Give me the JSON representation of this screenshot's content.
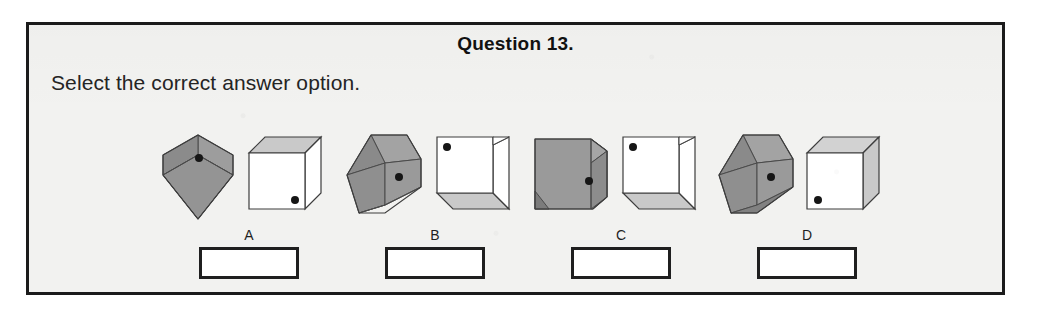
{
  "page": {
    "title": "Question 13.",
    "instruction": "Select the correct answer option."
  },
  "colors": {
    "frame_border": "#1b1b1b",
    "panel_background": "#f2f2f0",
    "cube_gray_light": "#a9a9a9",
    "cube_gray_mid": "#8f8f8f",
    "cube_gray_dark": "#787878",
    "cube_white": "#ffffff",
    "cube_shade": "#c9c9c9",
    "outline": "#333333",
    "dot": "#161616",
    "text": "#1f1f1f"
  },
  "options": [
    {
      "letter": "A",
      "answer_value": "",
      "gray_figure": {
        "name": "gray-cube-corner-view",
        "dot_position": "center-upper"
      },
      "white_figure": {
        "name": "white-cube-top-shaded",
        "dot_position": "front-face-bottom-right"
      }
    },
    {
      "letter": "B",
      "answer_value": "",
      "gray_figure": {
        "name": "gray-cube-corner-view-tilted",
        "dot_position": "center-right"
      },
      "white_figure": {
        "name": "white-cube-bottom-shaded",
        "dot_position": "front-face-top-left"
      }
    },
    {
      "letter": "C",
      "answer_value": "",
      "gray_figure": {
        "name": "gray-cube-front-view",
        "dot_position": "right-of-center"
      },
      "white_figure": {
        "name": "white-cube-bottom-shaded",
        "dot_position": "front-face-top-left"
      }
    },
    {
      "letter": "D",
      "answer_value": "",
      "gray_figure": {
        "name": "gray-cube-corner-view-tilted",
        "dot_position": "center-right"
      },
      "white_figure": {
        "name": "white-cube-top-right-shaded",
        "dot_position": "front-face-bottom-left"
      }
    }
  ]
}
